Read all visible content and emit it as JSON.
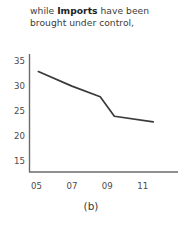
{
  "caption": {
    "line1_pre": "while ",
    "line1_bold": "Imports",
    "line1_post": " have been",
    "line2": "brought under control,"
  },
  "subfigure_label": "(b)",
  "colors": {
    "line": "#3a3a3a",
    "axis": "#6b6b6b",
    "text": "#3d3d3d"
  },
  "chart_data": {
    "type": "line",
    "title": "",
    "xlabel": "",
    "ylabel": "",
    "x": [
      "05",
      "06",
      "07",
      "08",
      "09",
      "10",
      "11",
      "12"
    ],
    "xtick_labels": [
      "05",
      "07",
      "09",
      "11"
    ],
    "ytick_labels": [
      "35",
      "30",
      "25",
      "20",
      "15"
    ],
    "ylim": [
      13,
      36.5
    ],
    "xlim": [
      4.6,
      13.0
    ],
    "grid": false,
    "legend": null,
    "series": [
      {
        "name": "Imports",
        "points": [
          {
            "x": 5.1,
            "y": 33.0
          },
          {
            "x": 7.0,
            "y": 30.1
          },
          {
            "x": 8.6,
            "y": 28.0
          },
          {
            "x": 9.4,
            "y": 24.1
          },
          {
            "x": 11.6,
            "y": 23.0
          }
        ]
      }
    ]
  }
}
